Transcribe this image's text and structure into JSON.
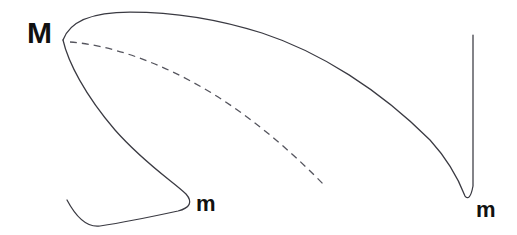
{
  "figure": {
    "title": "",
    "background_color": "#ffffff",
    "width": 517,
    "height": 235,
    "stroke_color": "#3a3a42",
    "dash_color": "#55555e",
    "label_color": "#111111"
  },
  "labels": {
    "maximum": "M",
    "minimum_left": "m",
    "minimum_right": "m"
  },
  "chart_data": {
    "type": "line",
    "title": "",
    "xlabel": "",
    "ylabel": "",
    "grid": false,
    "legend": false,
    "xlim": [
      0,
      517
    ],
    "ylim": [
      235,
      0
    ],
    "annotations": [
      {
        "text": "M",
        "x": 42,
        "y": 33,
        "style": "bold",
        "size": 30,
        "describes": "cusp-maximum-at-left-fold"
      },
      {
        "text": "m",
        "x": 209,
        "y": 204,
        "style": "bold",
        "size": 22,
        "describes": "local-minimum-lower-left-branch"
      },
      {
        "text": "m",
        "x": 488,
        "y": 210,
        "style": "bold",
        "size": 22,
        "describes": "sharp-minimum-right-branch"
      }
    ],
    "series": [
      {
        "name": "solid-curve",
        "style": "solid",
        "color": "#3a3a42",
        "path": "M 63 40 C 70 20 95 12 130 12 C 170 12 215 18 262 33 C 320 52 380 90 430 140 C 450 162 460 183 465 196 C 468 200 471 197 473 186 L 473 35",
        "description": "Upper branch: rises from left cusp M, arcs over, descends steeply to sharp minimum m at right, then turns up into near-vertical asymptotic branch."
      },
      {
        "name": "solid-curve-lower-left",
        "style": "solid",
        "color": "#3a3a42",
        "path": "M 63 40 C 68 62 85 95 115 130 C 145 164 175 183 186 194 C 193 202 190 208 178 211 C 155 216 120 223 100 226 C 86 228 75 215 67 200",
        "description": "Lower branch from cusp M descends in an S to a local minimum m, folds back left and tails off at lower left."
      },
      {
        "name": "dashed-curve",
        "style": "dashed",
        "color": "#55555e",
        "path": "M 70 42 C 110 45 160 62 210 92 C 258 121 300 160 325 186",
        "description": "Dashed metastable/spinodal branch emanating from the cusp M, descending to the right and terminating mid-figure."
      }
    ],
    "key_points": [
      {
        "name": "cusp-M",
        "x": 63,
        "y": 40
      },
      {
        "name": "apex-upper-arc",
        "x": 180,
        "y": 12
      },
      {
        "name": "minimum-left-m",
        "x": 189,
        "y": 197
      },
      {
        "name": "minimum-right-m",
        "x": 465,
        "y": 196
      },
      {
        "name": "vertical-branch-top",
        "x": 473,
        "y": 35
      },
      {
        "name": "dashed-end",
        "x": 325,
        "y": 186
      },
      {
        "name": "left-tail-end",
        "x": 67,
        "y": 200
      }
    ]
  }
}
